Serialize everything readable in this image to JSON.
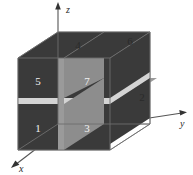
{
  "figure": {
    "type": "octree-cube-diagram",
    "axes": [
      {
        "id": "z",
        "label": "z",
        "direction": "up"
      },
      {
        "id": "y",
        "label": "y",
        "direction": "right"
      },
      {
        "id": "x",
        "label": "x",
        "direction": "down-left"
      }
    ],
    "octant_labels": [
      {
        "id": "1",
        "label": "1",
        "face": "front-bottom-left"
      },
      {
        "id": "2",
        "label": "2",
        "face": "right-side"
      },
      {
        "id": "3",
        "label": "3",
        "face": "front-bottom-right"
      },
      {
        "id": "4",
        "label": "4",
        "face": "top-left"
      },
      {
        "id": "6",
        "label": "6",
        "face": "top-right"
      },
      {
        "id": "5",
        "label": "5",
        "face": "front-top-left"
      },
      {
        "id": "7",
        "label": "7",
        "face": "front-top-right"
      }
    ],
    "colors": {
      "cube_edge": "#808080",
      "dark_face": "#3a3a3a",
      "mid_plane": "#8f8f8f",
      "light_plane": "#d2d2d2",
      "axis": "#555555",
      "label_on_dark": "#ffffff",
      "label_on_light": "#303030",
      "background": "#ffffff"
    }
  }
}
